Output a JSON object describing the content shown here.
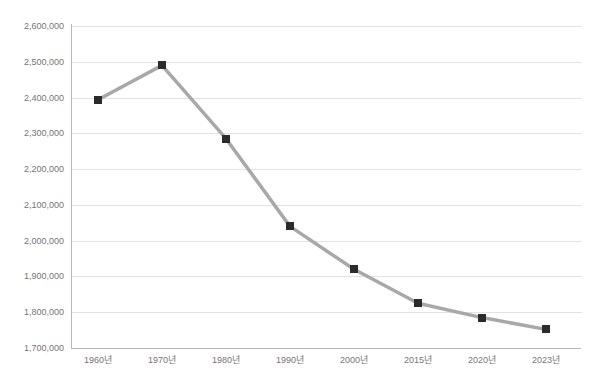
{
  "chart_data": {
    "type": "line",
    "title": "",
    "xlabel": "",
    "ylabel": "",
    "categories": [
      "1960년",
      "1970년",
      "1980년",
      "1990년",
      "2000년",
      "2015년",
      "2020년",
      "2023년"
    ],
    "values": [
      2394000,
      2490000,
      2285000,
      2040000,
      1920000,
      1825000,
      1785000,
      1752000
    ],
    "ylim": [
      1700000,
      2600000
    ],
    "yticks": [
      2600000,
      2500000,
      2400000,
      2300000,
      2200000,
      2100000,
      2000000,
      1900000,
      1800000,
      1700000
    ],
    "ytick_labels": [
      "2,600,000",
      "2,500,000",
      "2,400,000",
      "2,300,000",
      "2,200,000",
      "2,100,000",
      "2,000,000",
      "1,900,000",
      "1,800,000",
      "1,700,000"
    ],
    "grid": true,
    "legend": false,
    "legend_position": "none",
    "series": [
      {
        "name": "",
        "line_color": "#a8a8a8",
        "marker_color": "#2b2b2b",
        "marker_shape": "square",
        "values": [
          2394000,
          2490000,
          2285000,
          2040000,
          1920000,
          1825000,
          1785000,
          1752000
        ]
      }
    ],
    "colors": {
      "line": "#a8a8a8",
      "marker": "#2b2b2b",
      "grid": "#e2e2e2",
      "axis": "#b9b9b9",
      "tick_text": "#757575",
      "background": "#ffffff"
    }
  }
}
